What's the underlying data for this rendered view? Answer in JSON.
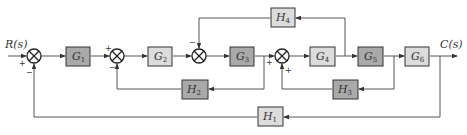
{
  "diagram": {
    "type": "block-diagram",
    "input_label": "R(s)",
    "output_label": "C(s)",
    "colors": {
      "dark_block": "#a9a9a9",
      "light_block": "#dcdcdc",
      "line": "#555555",
      "junction": "#222222"
    },
    "forward_blocks": [
      {
        "id": "G1",
        "name": "G",
        "sub": "1",
        "shade": "dark"
      },
      {
        "id": "G2",
        "name": "G",
        "sub": "2",
        "shade": "light"
      },
      {
        "id": "G3",
        "name": "G",
        "sub": "3",
        "shade": "dark"
      },
      {
        "id": "G4",
        "name": "G",
        "sub": "4",
        "shade": "light"
      },
      {
        "id": "G5",
        "name": "G",
        "sub": "5",
        "shade": "dark"
      },
      {
        "id": "G6",
        "name": "G",
        "sub": "6",
        "shade": "light"
      }
    ],
    "feedback_blocks": [
      {
        "id": "H1",
        "name": "H",
        "sub": "1",
        "shade": "light",
        "from": "output C(s)",
        "to": "sum1"
      },
      {
        "id": "H2",
        "name": "H",
        "sub": "2",
        "shade": "dark",
        "from": "after G3",
        "to": "sum2"
      },
      {
        "id": "H3",
        "name": "H",
        "sub": "3",
        "shade": "dark",
        "from": "after G5",
        "to": "sum4"
      },
      {
        "id": "H4",
        "name": "H",
        "sub": "4",
        "shade": "light",
        "from": "after G4",
        "to": "sum3"
      }
    ],
    "summing_junctions": [
      {
        "id": "sum1",
        "signs": {
          "main": "+",
          "feedback": "−"
        }
      },
      {
        "id": "sum2",
        "signs": {
          "main": "+",
          "feedback": "−"
        }
      },
      {
        "id": "sum3",
        "signs": {
          "feedback": "−"
        }
      },
      {
        "id": "sum4",
        "signs": {
          "main": "+",
          "feedback": "+"
        }
      }
    ]
  }
}
